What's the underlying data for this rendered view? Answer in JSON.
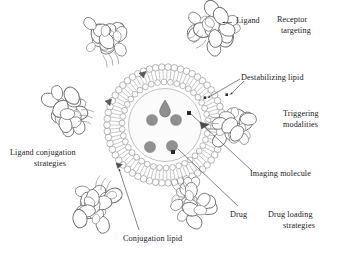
{
  "figure": {
    "type": "scientific-diagram",
    "background_color": "#ffffff",
    "line_color": "#6e6e6e",
    "dark_marker_color": "#4a4a4a",
    "drug_fill_color": "#909090",
    "text_color": "#1a1a1a"
  },
  "labels": {
    "ligand": "Ligand",
    "receptor_targeting_line1": "Receptor",
    "receptor_targeting_line2": "targeting",
    "destabilizing_lipid": "Destabilizing lipid",
    "triggering_line1": "Triggering",
    "triggering_line2": "modalities",
    "imaging_molecule": "Imaging molecule",
    "drug": "Drug",
    "drug_loading_line1": "Drug loading",
    "drug_loading_line2": "strategies",
    "conjugation_lipid": "Conjugation lipid",
    "ligand_conjugation_line1": "Ligand conjugation",
    "ligand_conjugation_line2": "strategies"
  },
  "components": {
    "vesicle": {
      "name": "liposome-bilayer-vesicle",
      "center_x": 165,
      "center_y": 125,
      "inner_lumen_radius": 36,
      "inner_leaflet_radius": 43,
      "outer_leaflet_radius": 58,
      "head_group_count_outer": 58,
      "head_group_count_inner": 42
    },
    "ligand_proteins": {
      "name": "antibody-ligand-protein",
      "count": 5,
      "positions": [
        {
          "x": 214,
          "y": 27,
          "rotation": -35
        },
        {
          "x": 232,
          "y": 128,
          "rotation": 18
        },
        {
          "x": 190,
          "y": 202,
          "rotation": 62
        },
        {
          "x": 95,
          "y": 203,
          "rotation": 115
        },
        {
          "x": 66,
          "y": 112,
          "rotation": 195
        },
        {
          "x": 105,
          "y": 40,
          "rotation": 255
        }
      ]
    },
    "drug_molecules": {
      "name": "drug-molecule",
      "count": 4,
      "fill": "#909090",
      "radius": 5.6,
      "positions": [
        {
          "x": 152,
          "y": 120
        },
        {
          "x": 176,
          "y": 120
        },
        {
          "x": 150,
          "y": 147
        },
        {
          "x": 172,
          "y": 146
        }
      ]
    },
    "destabilizing_lipids": {
      "name": "destabilizing-lipid-marker",
      "count": 4,
      "fill": "#4a4a4a",
      "positions": [
        {
          "x": 165,
          "y": 103
        },
        {
          "x": 143,
          "y": 76
        },
        {
          "x": 108,
          "y": 104
        },
        {
          "x": 206,
          "y": 125
        },
        {
          "x": 120,
          "y": 166
        }
      ]
    },
    "imaging_molecules": {
      "name": "imaging-molecule-marker",
      "count": 2,
      "fill": "#2a2a2a",
      "radius": 2.0,
      "positions": [
        {
          "x": 189,
          "y": 113
        },
        {
          "x": 173,
          "y": 152
        }
      ]
    }
  },
  "leader_lines": [
    {
      "name": "ligand-leader",
      "from": [
        232,
        22
      ],
      "to": [
        221,
        22
      ],
      "arrow": true
    },
    {
      "name": "destabilizing-lipid-leader",
      "from": [
        242,
        78
      ],
      "to": [
        206,
        98
      ],
      "arrow": true
    },
    {
      "name": "destabilizing-lipid-leader-2",
      "from": [
        245,
        80
      ],
      "to": [
        228,
        95
      ],
      "arrow": true
    },
    {
      "name": "imaging-molecule-leader",
      "from": [
        252,
        172
      ],
      "to": [
        192,
        115
      ],
      "arrow": false
    },
    {
      "name": "drug-leader",
      "from": [
        238,
        208
      ],
      "to": [
        180,
        148
      ],
      "arrow": false
    },
    {
      "name": "conjugation-lipid-leader",
      "from": [
        140,
        232
      ],
      "to": [
        117,
        168
      ],
      "arrow": true
    }
  ]
}
